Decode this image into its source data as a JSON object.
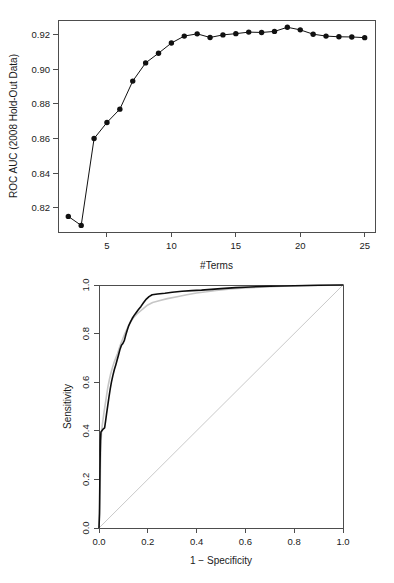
{
  "page": {
    "background_color": "#ffffff",
    "figure_count": 2
  },
  "chart_data": [
    {
      "id": "auc-vs-terms",
      "type": "line",
      "title": "",
      "xlabel": "#Terms",
      "ylabel": "ROC AUC (2008 Hold-Out Data)",
      "xlim": [
        1.2,
        25.8
      ],
      "ylim": [
        0.806,
        0.9285
      ],
      "xticks": [
        5,
        10,
        15,
        20,
        25
      ],
      "xtick_labels": [
        "5",
        "10",
        "15",
        "20",
        "25"
      ],
      "yticks": [
        0.82,
        0.84,
        0.86,
        0.88,
        0.9,
        0.92
      ],
      "ytick_labels": [
        "0.82",
        "0.84",
        "0.86",
        "0.88",
        "0.90",
        "0.92"
      ],
      "grid": false,
      "legend": "none",
      "marker": "filled-circle",
      "line_color": "#111111",
      "marker_color": "#111111",
      "x": [
        2,
        3,
        4,
        5,
        6,
        7,
        8,
        9,
        10,
        11,
        12,
        13,
        14,
        15,
        16,
        17,
        18,
        19,
        20,
        21,
        22,
        23,
        24,
        25
      ],
      "values": [
        0.815,
        0.8098,
        0.86,
        0.8693,
        0.877,
        0.8932,
        0.9037,
        0.9093,
        0.9152,
        0.9192,
        0.9205,
        0.9184,
        0.9199,
        0.9206,
        0.9215,
        0.9213,
        0.9219,
        0.9243,
        0.9228,
        0.9203,
        0.9192,
        0.9188,
        0.9187,
        0.9183
      ]
    },
    {
      "id": "roc-curves",
      "type": "line",
      "title": "",
      "xlabel": "1 − Specificity",
      "ylabel": "Sensitivity",
      "xlim": [
        0.0,
        1.0
      ],
      "ylim": [
        0.0,
        1.0
      ],
      "xticks": [
        0.0,
        0.2,
        0.4,
        0.6,
        0.8,
        1.0
      ],
      "xtick_labels": [
        "0.0",
        "0.2",
        "0.4",
        "0.6",
        "0.8",
        "1.0"
      ],
      "yticks": [
        0.0,
        0.2,
        0.4,
        0.6,
        0.8,
        1.0
      ],
      "ytick_labels": [
        "0.0",
        "0.2",
        "0.4",
        "0.6",
        "0.8",
        "1.0"
      ],
      "grid": false,
      "legend": "none",
      "reference_line": {
        "name": "chance-diagonal",
        "from": [
          0.0,
          0.0
        ],
        "to": [
          1.0,
          1.0
        ],
        "color": "#c9c9c9"
      },
      "series": [
        {
          "name": "model-roc-black",
          "color": "#0d0d0d",
          "points": [
            [
              0.0,
              0.0
            ],
            [
              0.002,
              0.06
            ],
            [
              0.003,
              0.15
            ],
            [
              0.004,
              0.24
            ],
            [
              0.005,
              0.31
            ],
            [
              0.006,
              0.36
            ],
            [
              0.008,
              0.395
            ],
            [
              0.018,
              0.408
            ],
            [
              0.023,
              0.412
            ],
            [
              0.027,
              0.44
            ],
            [
              0.031,
              0.47
            ],
            [
              0.036,
              0.505
            ],
            [
              0.041,
              0.54
            ],
            [
              0.046,
              0.572
            ],
            [
              0.051,
              0.6
            ],
            [
              0.057,
              0.628
            ],
            [
              0.063,
              0.652
            ],
            [
              0.069,
              0.672
            ],
            [
              0.074,
              0.69
            ],
            [
              0.08,
              0.712
            ],
            [
              0.086,
              0.735
            ],
            [
              0.092,
              0.752
            ],
            [
              0.097,
              0.758
            ],
            [
              0.104,
              0.772
            ],
            [
              0.11,
              0.795
            ],
            [
              0.116,
              0.815
            ],
            [
              0.122,
              0.833
            ],
            [
              0.129,
              0.848
            ],
            [
              0.136,
              0.862
            ],
            [
              0.144,
              0.875
            ],
            [
              0.152,
              0.886
            ],
            [
              0.161,
              0.898
            ],
            [
              0.172,
              0.912
            ],
            [
              0.183,
              0.928
            ],
            [
              0.194,
              0.942
            ],
            [
              0.205,
              0.952
            ],
            [
              0.218,
              0.96
            ],
            [
              0.24,
              0.963
            ],
            [
              0.27,
              0.966
            ],
            [
              0.3,
              0.97
            ],
            [
              0.34,
              0.974
            ],
            [
              0.38,
              0.977
            ],
            [
              0.42,
              0.979
            ],
            [
              0.46,
              0.982
            ],
            [
              0.5,
              0.985
            ],
            [
              0.56,
              0.989
            ],
            [
              0.62,
              0.992
            ],
            [
              0.7,
              0.995
            ],
            [
              0.8,
              0.997
            ],
            [
              0.9,
              0.999
            ],
            [
              1.0,
              1.0
            ]
          ]
        },
        {
          "name": "model-roc-gray",
          "color": "#c6c6c6",
          "points": [
            [
              0.0,
              0.0
            ],
            [
              0.003,
              0.08
            ],
            [
              0.005,
              0.18
            ],
            [
              0.006,
              0.27
            ],
            [
              0.008,
              0.34
            ],
            [
              0.01,
              0.39
            ],
            [
              0.013,
              0.42
            ],
            [
              0.017,
              0.45
            ],
            [
              0.021,
              0.48
            ],
            [
              0.026,
              0.512
            ],
            [
              0.031,
              0.545
            ],
            [
              0.036,
              0.578
            ],
            [
              0.042,
              0.608
            ],
            [
              0.048,
              0.635
            ],
            [
              0.055,
              0.66
            ],
            [
              0.062,
              0.682
            ],
            [
              0.069,
              0.7
            ],
            [
              0.076,
              0.718
            ],
            [
              0.083,
              0.74
            ],
            [
              0.09,
              0.76
            ],
            [
              0.098,
              0.78
            ],
            [
              0.106,
              0.8
            ],
            [
              0.115,
              0.82
            ],
            [
              0.124,
              0.838
            ],
            [
              0.134,
              0.855
            ],
            [
              0.145,
              0.87
            ],
            [
              0.157,
              0.882
            ],
            [
              0.17,
              0.893
            ],
            [
              0.185,
              0.906
            ],
            [
              0.2,
              0.918
            ],
            [
              0.22,
              0.928
            ],
            [
              0.25,
              0.936
            ],
            [
              0.28,
              0.944
            ],
            [
              0.32,
              0.952
            ],
            [
              0.36,
              0.96
            ],
            [
              0.4,
              0.967
            ],
            [
              0.44,
              0.972
            ],
            [
              0.48,
              0.978
            ],
            [
              0.54,
              0.984
            ],
            [
              0.6,
              0.988
            ],
            [
              0.68,
              0.992
            ],
            [
              0.78,
              0.996
            ],
            [
              0.88,
              0.998
            ],
            [
              1.0,
              1.0
            ]
          ]
        }
      ]
    }
  ]
}
